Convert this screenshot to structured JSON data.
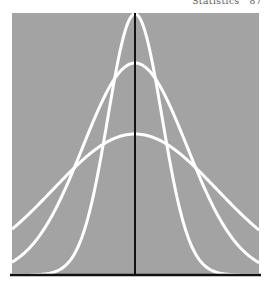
{
  "header": {
    "running_title": "Statistics",
    "page_number": "87"
  },
  "colors": {
    "panel": "#a3a3a3",
    "curve": "#ffffff",
    "axis": "#111111",
    "page": "#ffffff"
  },
  "chart_data": {
    "type": "line",
    "title": "",
    "xlabel": "",
    "ylabel": "",
    "grid": false,
    "legend": null,
    "mean_marker": "vertical line at center",
    "series": [
      {
        "name": "narrow",
        "mean": 0,
        "relative_peak": 1.0,
        "relative_sd": 0.33
      },
      {
        "name": "medium",
        "mean": 0,
        "relative_peak": 0.81,
        "relative_sd": 0.63
      },
      {
        "name": "wide",
        "mean": 0,
        "relative_peak": 0.54,
        "relative_sd": 1.0
      }
    ],
    "geometry_px": {
      "panel": {
        "x": 12,
        "y": 13,
        "width": 247,
        "height": 262
      },
      "center_x": 135,
      "baseline_y": 275,
      "curves": [
        {
          "name": "narrow",
          "peak_y": 14,
          "sigma_px": 27
        },
        {
          "name": "medium",
          "peak_y": 63,
          "sigma_px": 52
        },
        {
          "name": "wide",
          "peak_y": 134,
          "sigma_px": 82
        }
      ]
    }
  }
}
